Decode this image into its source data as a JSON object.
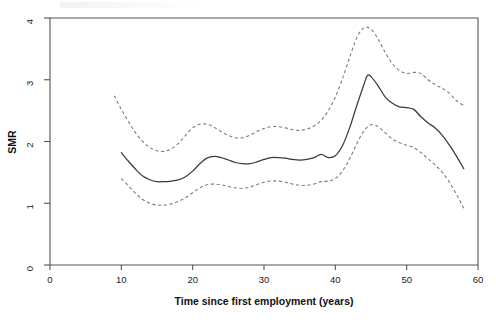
{
  "chart_data": {
    "type": "line",
    "title": "",
    "xlabel": "Time since first employment (years)",
    "ylabel": "SMR",
    "xlim": [
      0,
      60
    ],
    "ylim": [
      0,
      4
    ],
    "xticks": [
      0,
      10,
      20,
      30,
      40,
      50,
      60
    ],
    "yticks": [
      0,
      1,
      2,
      3,
      4
    ],
    "xtick_labels": [
      "0",
      "10",
      "20",
      "30",
      "40",
      "50",
      "60"
    ],
    "ytick_labels": [
      "0",
      "1",
      "2",
      "3",
      "4"
    ],
    "grid": false,
    "legend": "none",
    "series": [
      {
        "name": "SMR (fitted smooth)",
        "style": "solid",
        "color": "#3b3b3b",
        "x": [
          10.0,
          11.0,
          12.0,
          13.0,
          14.0,
          15.0,
          16.0,
          17.0,
          18.0,
          19.0,
          20.0,
          21.0,
          22.0,
          23.0,
          24.0,
          25.0,
          26.0,
          27.0,
          28.0,
          29.0,
          30.0,
          31.0,
          32.0,
          33.0,
          34.0,
          35.0,
          36.0,
          37.0,
          38.0,
          39.0,
          40.0,
          41.0,
          42.0,
          43.0,
          44.0,
          44.5,
          45.0,
          46.0,
          47.0,
          48.0,
          49.0,
          50.0,
          51.0,
          52.0,
          53.0,
          54.0,
          55.0,
          56.0,
          57.0,
          58.0
        ],
        "y": [
          1.82,
          1.68,
          1.55,
          1.44,
          1.38,
          1.35,
          1.35,
          1.36,
          1.38,
          1.43,
          1.52,
          1.64,
          1.73,
          1.76,
          1.74,
          1.7,
          1.66,
          1.64,
          1.64,
          1.67,
          1.71,
          1.74,
          1.74,
          1.73,
          1.71,
          1.7,
          1.71,
          1.74,
          1.79,
          1.74,
          1.77,
          1.93,
          2.22,
          2.58,
          2.92,
          3.07,
          3.05,
          2.9,
          2.72,
          2.62,
          2.56,
          2.55,
          2.52,
          2.4,
          2.3,
          2.22,
          2.1,
          1.94,
          1.76,
          1.56
        ]
      },
      {
        "name": "Upper 95% confidence limit",
        "style": "dashed",
        "color": "#7d7d7d",
        "x": [
          9.0,
          10.0,
          11.0,
          12.0,
          13.0,
          14.0,
          15.0,
          16.0,
          17.0,
          18.0,
          19.0,
          20.0,
          21.0,
          22.0,
          23.0,
          24.0,
          25.0,
          26.0,
          27.0,
          28.0,
          29.0,
          30.0,
          31.0,
          32.0,
          33.0,
          34.0,
          35.0,
          36.0,
          37.0,
          38.0,
          39.0,
          40.0,
          41.0,
          42.0,
          43.0,
          44.0,
          45.0,
          46.0,
          47.0,
          48.0,
          49.0,
          50.0,
          51.0,
          52.0,
          53.0,
          54.0,
          55.0,
          56.0,
          57.0,
          58.0
        ],
        "y": [
          2.74,
          2.52,
          2.32,
          2.14,
          2.0,
          1.9,
          1.85,
          1.84,
          1.88,
          1.97,
          2.1,
          2.22,
          2.28,
          2.28,
          2.23,
          2.16,
          2.1,
          2.06,
          2.06,
          2.1,
          2.16,
          2.21,
          2.24,
          2.24,
          2.22,
          2.19,
          2.18,
          2.2,
          2.25,
          2.34,
          2.5,
          2.72,
          3.02,
          3.36,
          3.68,
          3.84,
          3.82,
          3.66,
          3.44,
          3.26,
          3.15,
          3.1,
          3.12,
          3.1,
          3.0,
          2.92,
          2.86,
          2.78,
          2.66,
          2.58
        ]
      },
      {
        "name": "Lower 95% confidence limit",
        "style": "dashed",
        "color": "#7d7d7d",
        "x": [
          10.0,
          11.0,
          12.0,
          13.0,
          14.0,
          15.0,
          16.0,
          17.0,
          18.0,
          19.0,
          20.0,
          21.0,
          22.0,
          23.0,
          24.0,
          25.0,
          26.0,
          27.0,
          28.0,
          29.0,
          30.0,
          31.0,
          32.0,
          33.0,
          34.0,
          35.0,
          36.0,
          37.0,
          38.0,
          39.0,
          40.0,
          41.0,
          42.0,
          43.0,
          44.0,
          45.0,
          46.0,
          47.0,
          48.0,
          49.0,
          50.0,
          51.0,
          52.0,
          53.0,
          54.0,
          55.0,
          56.0,
          57.0,
          58.0
        ],
        "y": [
          1.4,
          1.28,
          1.16,
          1.06,
          1.0,
          0.97,
          0.97,
          0.99,
          1.03,
          1.09,
          1.17,
          1.25,
          1.3,
          1.31,
          1.3,
          1.27,
          1.25,
          1.24,
          1.26,
          1.3,
          1.34,
          1.36,
          1.36,
          1.34,
          1.31,
          1.29,
          1.29,
          1.31,
          1.35,
          1.36,
          1.4,
          1.52,
          1.72,
          1.96,
          2.17,
          2.27,
          2.24,
          2.14,
          2.04,
          1.98,
          1.94,
          1.9,
          1.82,
          1.72,
          1.62,
          1.5,
          1.34,
          1.14,
          0.92
        ]
      }
    ]
  }
}
